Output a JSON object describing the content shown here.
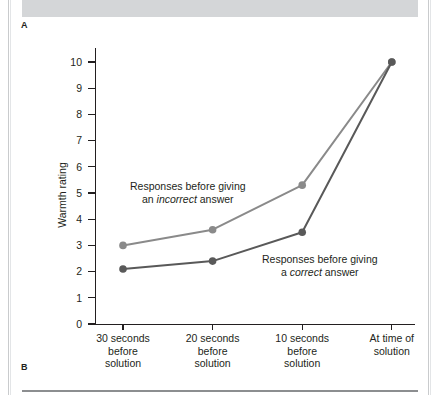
{
  "figure": {
    "panel_a_label": "A",
    "panel_b_label": "B"
  },
  "chart_data": {
    "type": "line",
    "title": "",
    "xlabel": "",
    "ylabel": "Warmth rating",
    "ylim": [
      0,
      10
    ],
    "yticks": [
      0,
      1,
      2,
      3,
      4,
      5,
      6,
      7,
      8,
      9,
      10
    ],
    "ytick_labels": [
      "0",
      "1",
      "2",
      "3",
      "4",
      "5",
      "6",
      "7",
      "8",
      "9",
      "10"
    ],
    "grid": false,
    "legend_position": "inline-annotations",
    "categories": [
      "30 seconds before solution",
      "20 seconds before solution",
      "10 seconds before solution",
      "At time of solution"
    ],
    "category_lines": [
      [
        "30 seconds",
        "before",
        "solution"
      ],
      [
        "20 seconds",
        "before",
        "solution"
      ],
      [
        "10 seconds",
        "before",
        "solution"
      ],
      [
        "At time of",
        "solution"
      ]
    ],
    "series": [
      {
        "name": "Responses before giving an incorrect answer",
        "values": [
          3.0,
          3.6,
          5.3,
          10.0
        ],
        "color": "#8a8a8a",
        "annotation_line1": "Responses before giving",
        "annotation_line2_prefix": "an ",
        "annotation_line2_italic": "incorrect",
        "annotation_line2_suffix": " answer"
      },
      {
        "name": "Responses before giving a correct answer",
        "values": [
          2.1,
          2.4,
          3.5,
          10.0
        ],
        "color": "#595959",
        "annotation_line1": "Responses before giving",
        "annotation_line2_prefix": "a ",
        "annotation_line2_italic": "correct",
        "annotation_line2_suffix": " answer"
      }
    ]
  }
}
